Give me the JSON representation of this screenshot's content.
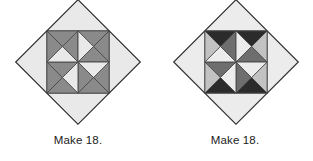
{
  "figure": {
    "background": "#ffffff",
    "blocks": [
      {
        "id": "block-left",
        "name": "pinwheel-block-medium",
        "caption": "Make 18.",
        "center": {
          "x": 78,
          "y": 69
        },
        "half_diagonal": 62,
        "outline_color": "#3a3a3a",
        "outline_width": 1,
        "colors": {
          "light": "#e9e9e9",
          "light_alt": "#dcdcdc",
          "medium": "#b5b5b5",
          "accent": "#8a8a8a",
          "accent_dark": "#6f6f6f",
          "seam": "#4a4a4a"
        },
        "patches": [
          {
            "role": "corner-triangle-light",
            "count": 4,
            "color": "#e9e9e9"
          },
          {
            "role": "pinwheel-parallelogram",
            "count": 4,
            "color": "#8a8a8a"
          },
          {
            "role": "pinwheel-blade",
            "count": 4,
            "color": "#8a8a8a"
          },
          {
            "role": "inner-square-light",
            "count": 4,
            "color": "#dcdcdc"
          }
        ]
      },
      {
        "id": "block-right",
        "name": "pinwheel-block-dark",
        "caption": "Make 18.",
        "center": {
          "x": 236,
          "y": 69
        },
        "half_diagonal": 62,
        "outline_color": "#3a3a3a",
        "outline_width": 1,
        "colors": {
          "light": "#ececec",
          "light_alt": "#dedede",
          "medium": "#c2c2c2",
          "accent": "#2b2b2b",
          "accent_dark": "#1f1f1f",
          "seam": "#4a4a4a"
        },
        "patches": [
          {
            "role": "corner-triangle-light",
            "count": 4,
            "color": "#ececec"
          },
          {
            "role": "pinwheel-parallelogram",
            "count": 4,
            "color": "#2b2b2b"
          },
          {
            "role": "pinwheel-blade",
            "count": 4,
            "color": "#6e6e6e"
          },
          {
            "role": "inner-square-light",
            "count": 4,
            "color": "#dedede"
          }
        ]
      }
    ]
  }
}
